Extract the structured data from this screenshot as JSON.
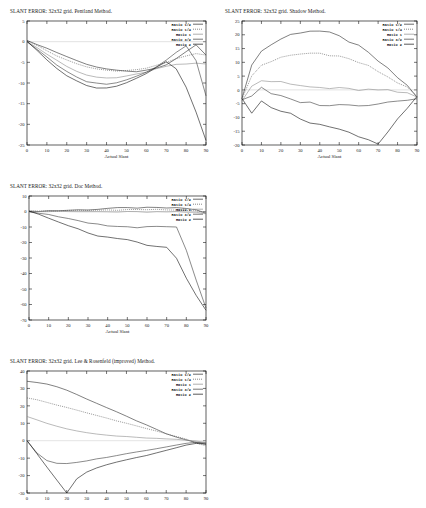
{
  "document": {
    "background": "#ffffff",
    "axis_color": "#1a1a1a",
    "width": 426,
    "height": 508
  },
  "legend_entries": [
    {
      "label": "Ratio 1/2",
      "color": "#2b2b2b",
      "dash": "none"
    },
    {
      "label": "Ratio 1/4",
      "color": "#555555",
      "dash": "1,1"
    },
    {
      "label": "Ratio 1",
      "color": "#8c8c8c",
      "dash": "none"
    },
    {
      "label": "Ratio 3/2",
      "color": "#3d3d3d",
      "dash": "none"
    },
    {
      "label": "Ratio 2",
      "color": "#111111",
      "dash": "none"
    }
  ],
  "panels": [
    {
      "id": "pentland",
      "title": "SLANT ERROR:  32x32 grid. Pentland Method.",
      "xlabel": "Actual Slant"
    },
    {
      "id": "shadow",
      "title": "SLANT ERROR:  32x32 grid. Shadow Method.",
      "xlabel": "Actual Slant"
    },
    {
      "id": "doc",
      "title": "SLANT ERROR:  32x32 grid. Doc Method.",
      "xlabel": "Actual Slant"
    },
    {
      "id": "lee",
      "title": "SLANT ERROR:  32x32 grid. Lee & Rosenfeld (improved) Method.",
      "xlabel": ""
    }
  ],
  "chart_data": [
    {
      "type": "line",
      "id": "pentland",
      "title": "SLANT ERROR:  32x32 grid. Pentland Method.",
      "xlabel": "Actual Slant",
      "ylabel": "",
      "xlim": [
        0,
        90
      ],
      "ylim": [
        -25,
        5
      ],
      "xticks": [
        0,
        10,
        20,
        30,
        40,
        50,
        60,
        70,
        80,
        90
      ],
      "yticks": [
        5,
        0,
        -5,
        -10,
        -15,
        -20,
        -25
      ],
      "grid": false,
      "legend_position": "top-right",
      "x": [
        0,
        5,
        10,
        15,
        20,
        25,
        30,
        35,
        40,
        45,
        50,
        55,
        60,
        65,
        70,
        75,
        80,
        85,
        90
      ],
      "series": [
        {
          "name": "Ratio 1/2",
          "values": [
            0.2,
            -0.6,
            -1.6,
            -2.6,
            -3.6,
            -4.6,
            -5.4,
            -6.1,
            -6.6,
            -7.0,
            -7.2,
            -7.2,
            -7.0,
            -6.5,
            -5.6,
            -4.2,
            -2.4,
            -0.8,
            -3.2
          ]
        },
        {
          "name": "Ratio 1/4",
          "values": [
            0.2,
            -0.9,
            -2.2,
            -3.4,
            -4.5,
            -5.4,
            -6.1,
            -6.6,
            -6.9,
            -7.0,
            -7.0,
            -6.8,
            -6.4,
            -5.8,
            -5.0,
            -4.1,
            -3.4,
            -3.0,
            -3.3
          ]
        },
        {
          "name": "Ratio 1",
          "values": [
            0.1,
            -1.4,
            -3.0,
            -4.6,
            -6.0,
            -7.2,
            -8.1,
            -8.6,
            -8.8,
            -8.7,
            -8.4,
            -7.9,
            -7.3,
            -6.6,
            -6.0,
            -5.6,
            -5.4,
            -5.3,
            -5.4
          ]
        },
        {
          "name": "Ratio 3/2",
          "values": [
            0.0,
            -1.8,
            -3.8,
            -5.7,
            -7.3,
            -8.6,
            -9.6,
            -10.1,
            -10.2,
            -9.9,
            -9.3,
            -8.4,
            -7.3,
            -6.0,
            -4.4,
            -2.6,
            -1.0,
            -4.5,
            -13.0
          ]
        },
        {
          "name": "Ratio 2",
          "values": [
            0.0,
            -2.1,
            -4.3,
            -6.4,
            -8.2,
            -9.6,
            -10.6,
            -11.1,
            -11.2,
            -10.8,
            -10.0,
            -8.9,
            -7.6,
            -6.2,
            -4.8,
            -6.5,
            -11.0,
            -17.0,
            -24.0
          ]
        }
      ]
    },
    {
      "type": "line",
      "id": "shadow",
      "title": "SLANT ERROR:  32x32 grid. Shadow Method.",
      "xlabel": "Actual Slant",
      "ylabel": "",
      "xlim": [
        0,
        90
      ],
      "ylim": [
        -20,
        25
      ],
      "xticks": [
        0,
        10,
        20,
        30,
        40,
        50,
        60,
        70,
        80,
        90
      ],
      "yticks": [
        25,
        20,
        15,
        10,
        5,
        0,
        -5,
        -10,
        -15,
        -20
      ],
      "grid": false,
      "legend_position": "top-right",
      "x": [
        0,
        5,
        10,
        15,
        20,
        25,
        30,
        35,
        40,
        45,
        50,
        55,
        60,
        65,
        70,
        75,
        80,
        85,
        90
      ],
      "series": [
        {
          "name": "Ratio 1/2",
          "values": [
            -3.5,
            9.5,
            14.0,
            16.5,
            18.5,
            20.0,
            21.0,
            21.5,
            21.3,
            20.5,
            19.3,
            17.7,
            15.7,
            13.3,
            10.5,
            7.5,
            4.5,
            1.5,
            -2.5
          ]
        },
        {
          "name": "Ratio 1/4",
          "values": [
            -3.5,
            5.0,
            9.0,
            10.5,
            11.5,
            12.3,
            13.0,
            13.3,
            13.3,
            12.9,
            12.2,
            11.2,
            10.0,
            8.5,
            6.8,
            4.8,
            2.8,
            0.5,
            -2.5
          ]
        },
        {
          "name": "Ratio 1",
          "values": [
            -3.5,
            1.5,
            3.5,
            2.5,
            3.0,
            2.0,
            1.5,
            1.0,
            0.8,
            0.6,
            0.4,
            0.2,
            0.1,
            0.0,
            -0.2,
            -0.4,
            -0.8,
            -1.5,
            -2.6
          ]
        },
        {
          "name": "Ratio 3/2",
          "values": [
            -3.5,
            -2.0,
            0.5,
            -1.5,
            -2.5,
            -3.5,
            -4.2,
            -4.8,
            -5.2,
            -5.5,
            -5.6,
            -5.6,
            -5.4,
            -5.2,
            -4.8,
            -4.4,
            -4.0,
            -3.4,
            -2.7
          ]
        },
        {
          "name": "Ratio 2",
          "values": [
            -3.5,
            -8.5,
            -3.5,
            -6.0,
            -7.5,
            -9.0,
            -10.5,
            -11.5,
            -12.5,
            -13.5,
            -14.5,
            -15.5,
            -16.5,
            -18.0,
            -19.5,
            -15.0,
            -10.5,
            -6.5,
            -2.8
          ]
        }
      ]
    },
    {
      "type": "line",
      "id": "doc",
      "title": "SLANT ERROR:  32x32 grid. Doc Method.",
      "xlabel": "Actual Slant",
      "ylabel": "",
      "xlim": [
        0,
        90
      ],
      "ylim": [
        -70,
        10
      ],
      "xticks": [
        0,
        10,
        20,
        30,
        40,
        50,
        60,
        70,
        80,
        90
      ],
      "yticks": [
        10,
        0,
        -10,
        -20,
        -30,
        -40,
        -50,
        -60,
        -70
      ],
      "grid": false,
      "legend_position": "top-right",
      "x": [
        0,
        5,
        10,
        15,
        20,
        25,
        30,
        35,
        40,
        45,
        50,
        55,
        60,
        65,
        70,
        75,
        80,
        85,
        90
      ],
      "series": [
        {
          "name": "Ratio 1/2",
          "values": [
            0.0,
            0.3,
            0.5,
            0.6,
            0.8,
            1.0,
            1.2,
            1.5,
            2.0,
            2.2,
            2.3,
            2.4,
            2.4,
            2.4,
            2.3,
            2.2,
            2.0,
            1.0,
            -1.0
          ]
        },
        {
          "name": "Ratio 1/4",
          "values": [
            0.0,
            0.2,
            0.3,
            0.4,
            0.5,
            0.6,
            0.7,
            0.8,
            1.0,
            1.1,
            1.2,
            1.2,
            1.2,
            1.2,
            1.1,
            1.0,
            0.8,
            0.2,
            -1.2
          ]
        },
        {
          "name": "Ratio 1",
          "values": [
            0.0,
            0.0,
            0.0,
            -0.1,
            -0.1,
            -0.2,
            -0.2,
            -0.2,
            -0.3,
            -0.3,
            -0.3,
            -0.3,
            -0.3,
            -0.3,
            -0.4,
            -0.4,
            -0.5,
            -0.8,
            -1.5
          ]
        },
        {
          "name": "Ratio 3/2",
          "values": [
            0.0,
            -1.0,
            -2.2,
            -3.5,
            -4.8,
            -6.0,
            -7.2,
            -8.3,
            -9.0,
            -9.5,
            -10.0,
            -10.6,
            -9.5,
            -9.3,
            -9.6,
            -10.0,
            -25.0,
            -44.0,
            -62.0
          ]
        },
        {
          "name": "Ratio 2",
          "values": [
            0.0,
            -1.8,
            -4.0,
            -6.5,
            -9.0,
            -11.5,
            -13.8,
            -15.5,
            -16.5,
            -17.5,
            -18.3,
            -19.8,
            -21.5,
            -22.5,
            -23.0,
            -30.0,
            -43.0,
            -54.0,
            -64.0
          ]
        }
      ]
    },
    {
      "type": "line",
      "id": "lee",
      "title": "SLANT ERROR:  32x32 grid. Lee & Rosenfeld (improved) Method.",
      "xlabel": "",
      "ylabel": "",
      "xlim": [
        0,
        90
      ],
      "ylim": [
        -30,
        40
      ],
      "xticks": [
        0,
        10,
        20,
        30,
        40,
        50,
        60,
        70,
        80,
        90
      ],
      "yticks": [
        40,
        30,
        20,
        10,
        0,
        -10,
        -20,
        -30
      ],
      "grid": false,
      "legend_position": "top-right",
      "x": [
        0,
        5,
        10,
        15,
        20,
        25,
        30,
        35,
        40,
        45,
        50,
        55,
        60,
        65,
        70,
        75,
        80,
        85,
        90
      ],
      "series": [
        {
          "name": "Ratio 1/2",
          "values": [
            34.0,
            33.5,
            32.5,
            31.0,
            29.0,
            26.5,
            24.0,
            21.5,
            19.0,
            16.5,
            14.0,
            11.5,
            9.0,
            6.5,
            4.0,
            2.0,
            0.5,
            -1.0,
            -2.0
          ]
        },
        {
          "name": "Ratio 1/4",
          "values": [
            24.5,
            23.5,
            22.0,
            20.5,
            19.0,
            17.5,
            16.0,
            14.5,
            13.0,
            11.5,
            10.0,
            8.5,
            7.0,
            5.5,
            4.0,
            2.5,
            1.0,
            -1.5,
            -3.0
          ]
        },
        {
          "name": "Ratio 1",
          "values": [
            14.0,
            12.0,
            10.0,
            8.2,
            6.8,
            5.6,
            4.6,
            3.8,
            3.2,
            2.7,
            2.3,
            1.9,
            1.6,
            1.3,
            1.0,
            0.7,
            0.3,
            -0.3,
            -1.0
          ]
        },
        {
          "name": "Ratio 3/2",
          "values": [
            0.0,
            -7.0,
            -11.5,
            -13.0,
            -13.2,
            -12.5,
            -11.5,
            -10.5,
            -9.5,
            -8.5,
            -7.5,
            -6.5,
            -5.5,
            -4.5,
            -3.5,
            -2.5,
            -1.5,
            -0.8,
            -1.2
          ]
        },
        {
          "name": "Ratio 2",
          "values": [
            0.0,
            -7.5,
            -15.0,
            -22.5,
            -30.0,
            -22.0,
            -18.0,
            -15.5,
            -13.8,
            -12.3,
            -11.0,
            -9.7,
            -8.4,
            -7.0,
            -5.5,
            -4.0,
            -2.5,
            -1.5,
            -2.0
          ]
        }
      ]
    }
  ]
}
